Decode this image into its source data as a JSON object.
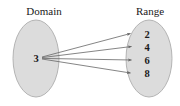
{
  "diagram": {
    "type": "mapping-diagram",
    "background_color": "#ffffff",
    "ellipse_fill": "#dcdcdc",
    "ellipse_stroke": "#b4b4b4",
    "arrow_color": "#666666",
    "text_color": "#1a1a1a",
    "domain": {
      "label": "Domain",
      "elements": [
        {
          "value": "3"
        }
      ]
    },
    "range": {
      "label": "Range",
      "elements": [
        {
          "value": "2"
        },
        {
          "value": "4"
        },
        {
          "value": "6"
        },
        {
          "value": "8"
        }
      ]
    },
    "mappings": [
      {
        "from": "3",
        "to": "2"
      },
      {
        "from": "3",
        "to": "4"
      },
      {
        "from": "3",
        "to": "6"
      },
      {
        "from": "3",
        "to": "8"
      }
    ]
  }
}
